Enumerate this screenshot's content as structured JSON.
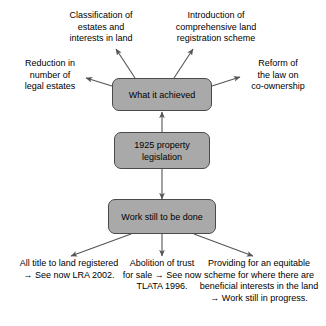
{
  "diagram": {
    "colors": {
      "box_fill": "#a9a9a9",
      "box_border": "#4a4a4a",
      "arrow": "#555555",
      "text": "#000000",
      "background": "#ffffff"
    },
    "nodes": {
      "achieved": "What it achieved",
      "legislation": "1925 property\nlegislation",
      "work": "Work still to be done"
    },
    "achievements": {
      "reduction": "Reduction in\nnumber of\nlegal estates",
      "classification": "Classification of\nestates and\ninterests in land",
      "introduction": "Introduction of\ncomprehensive land\nregistration scheme",
      "reform": "Reform of\nthe law on\nco-ownership"
    },
    "outstanding_work": {
      "title_registration": "All title to land registered\n→ See now LRA 2002.",
      "trust_for_sale": "Abolition of trust\nfor sale → See now\nTLATA 1996.",
      "equitable_scheme": "Providing for an equitable\nscheme for where there are\nbeneficial interests in the land\n→ Work still in progress."
    }
  }
}
